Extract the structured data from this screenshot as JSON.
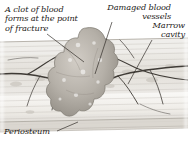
{
  "figure": {
    "background_color": "#ffffff",
    "ink_color": "#1d1a17",
    "bone_tint": "#e9e7e2",
    "clot_tint": "#b9b4ac",
    "vessel_color": "#4a4views"
  },
  "labels": {
    "clot": {
      "line1": "A clot of blood",
      "line2": "forms at the point",
      "line3": "of fracture"
    },
    "vessels": {
      "line1": "Damaged blood",
      "line2": "vessels"
    },
    "marrow": {
      "line1": "Marrow",
      "line2": "cavity"
    },
    "periosteum": {
      "line1": "Periosteum"
    }
  },
  "structures": [
    {
      "name": "blood-clot",
      "description": "irregular lumpy mass spanning the fracture gap at the centre of the bone shaft"
    },
    {
      "name": "damaged-blood-vessels",
      "description": "dark branching vessels torn at the fracture site"
    },
    {
      "name": "marrow-cavity",
      "description": "pale open cavity inside the bone shaft on the right"
    },
    {
      "name": "periosteum",
      "description": "thin outer membrane layer along the bottom of the bone shaft"
    },
    {
      "name": "compact-bone",
      "description": "layered striated bone tissue forming the shaft walls"
    }
  ],
  "leaders": [
    {
      "name": "clot-leader",
      "from": "of fracture",
      "to": "blood-clot"
    },
    {
      "name": "vessels-leader",
      "from": "vessels",
      "to": "damaged-blood-vessels"
    },
    {
      "name": "marrow-leader",
      "from": "cavity",
      "to": "marrow-cavity"
    },
    {
      "name": "periosteum-leader",
      "from": "Periosteum",
      "to": "periosteum"
    }
  ]
}
